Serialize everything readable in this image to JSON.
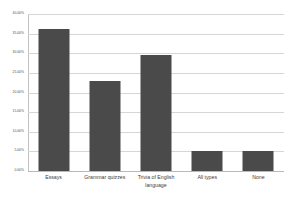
{
  "chart_data": {
    "type": "bar",
    "title": "",
    "subtitle": "",
    "xlabel": "",
    "ylabel": "",
    "categories": [
      "Essays",
      "Grammar quizzes",
      "Trivia of English language",
      "All types",
      "None"
    ],
    "values": [
      36.2,
      23.0,
      29.6,
      5.1,
      5.1
    ],
    "value_format": "percent",
    "ylim": [
      0,
      40
    ],
    "ytick_values": [
      0,
      5,
      10,
      15,
      20,
      25,
      30,
      35,
      40
    ],
    "ytick_labels": [
      "0.00%",
      "5.00%",
      "10.00%",
      "15.00%",
      "20.00%",
      "25.00%",
      "30.00%",
      "35.00%",
      "40.00%"
    ],
    "grid": true,
    "grid_axis": "y",
    "legend": false,
    "legend_position": "none",
    "series": [
      {
        "name": "Preferred activity",
        "values": [
          36.2,
          23.0,
          29.6,
          5.1,
          5.1
        ]
      }
    ]
  },
  "style": {
    "bar_color": "#4a4a4a",
    "grid_color": "#d6d6d6",
    "axis_color": "#b9b9b9",
    "background": "#ffffff",
    "label_color": "#3d3d3d"
  }
}
